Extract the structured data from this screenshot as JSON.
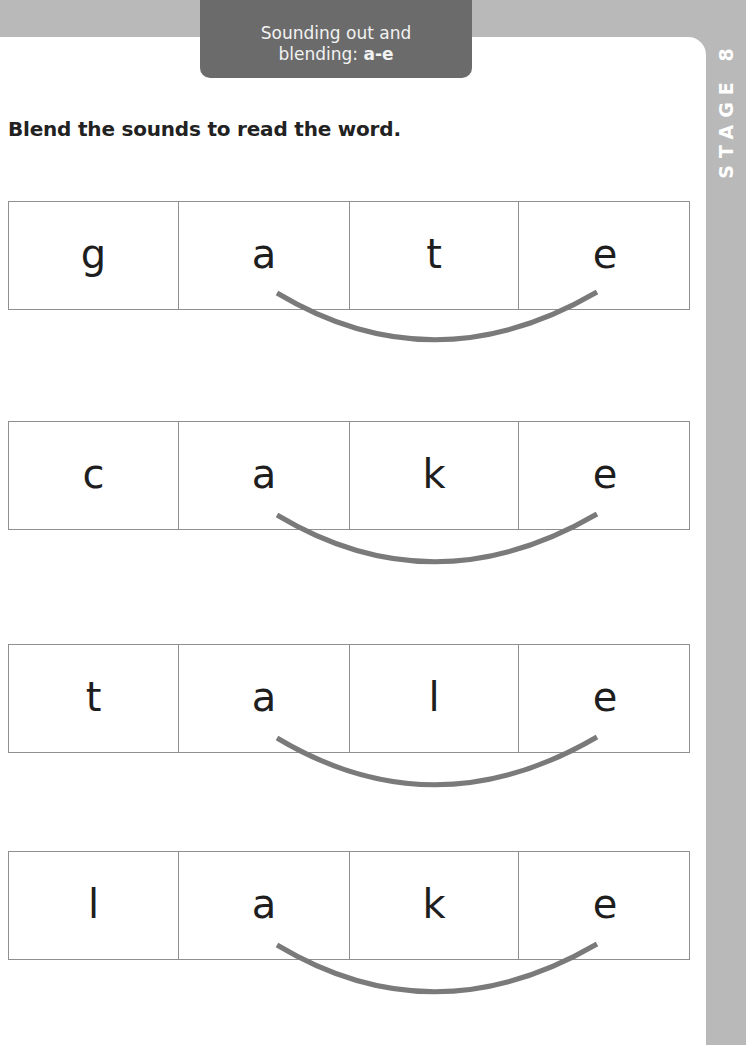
{
  "header": {
    "topic_line1": "Sounding out and",
    "topic_line2_prefix": "blending: ",
    "topic_line2_bold": "a-e",
    "stage_label": "STAGE 8"
  },
  "instruction": "Blend the sounds to read the word.",
  "words": [
    {
      "letters": [
        "g",
        "a",
        "t",
        "e"
      ],
      "split_digraph": "a-e"
    },
    {
      "letters": [
        "c",
        "a",
        "k",
        "e"
      ],
      "split_digraph": "a-e"
    },
    {
      "letters": [
        "t",
        "a",
        "l",
        "e"
      ],
      "split_digraph": "a-e"
    },
    {
      "letters": [
        "l",
        "a",
        "k",
        "e"
      ],
      "split_digraph": "a-e"
    }
  ],
  "colors": {
    "page_background": "#b9b9b9",
    "panel": "#ffffff",
    "tab": "#6b6b6b",
    "grid_line": "#8f8f8f",
    "arc": "#7a7a7a",
    "text": "#1e1e1e"
  }
}
